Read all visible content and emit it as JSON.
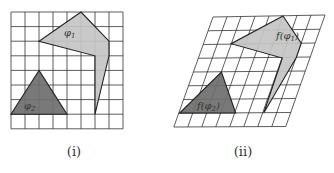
{
  "panels": [
    {
      "caption": "(i)",
      "grid": "regular",
      "shapes": [
        {
          "name": "phi1",
          "label": "φ1",
          "fill": "#c4c4c4",
          "vertices": [
            [
              5,
              0
            ],
            [
              7,
              2
            ],
            [
              7,
              3
            ],
            [
              6,
              7
            ],
            [
              6,
              3
            ],
            [
              2,
              2
            ]
          ]
        },
        {
          "name": "phi2",
          "label": "φ2",
          "fill": "#6e6e6e",
          "vertices": [
            [
              2,
              4
            ],
            [
              4,
              7
            ],
            [
              0,
              7
            ]
          ]
        }
      ]
    },
    {
      "caption": "(ii)",
      "grid": "sheared",
      "shapes": [
        {
          "name": "f-phi1",
          "label": "f(φ1)",
          "fill": "#c4c4c4"
        },
        {
          "name": "f-phi2",
          "label": "f(φ2)",
          "fill": "#6e6e6e"
        }
      ]
    }
  ],
  "colors": {
    "grid_line": "#333333",
    "light_fill": "#c4c4c4",
    "dark_fill": "#6e6e6e"
  }
}
